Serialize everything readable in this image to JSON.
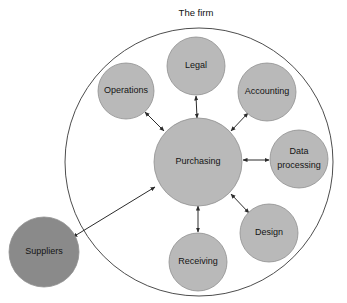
{
  "diagram": {
    "title": "The firm",
    "type": "hub-and-spoke network diagram",
    "canvas": {
      "width": 347,
      "height": 303,
      "background": "#ffffff"
    },
    "colors": {
      "node_fill_light": "#b9b9b9",
      "node_fill_dark": "#8a8a8a",
      "node_stroke": "#8f8f8f",
      "boundary_stroke": "#4d4d4d",
      "link_stroke": "#2b2b2b",
      "label_text": "#141414"
    },
    "boundary": {
      "label": "The firm",
      "label_x": 196,
      "label_y": 13,
      "cx": 199,
      "cy": 162,
      "r": 134
    },
    "nodes": [
      {
        "id": "legal",
        "label": "Legal",
        "label_line2": "",
        "cx": 196,
        "cy": 66,
        "r": 29,
        "fill": "#b9b9b9",
        "inside_firm": true
      },
      {
        "id": "operations",
        "label": "Operations",
        "label_line2": "",
        "cx": 126,
        "cy": 91,
        "r": 28,
        "fill": "#b9b9b9",
        "inside_firm": true
      },
      {
        "id": "accounting",
        "label": "Accounting",
        "label_line2": "",
        "cx": 267,
        "cy": 92,
        "r": 29,
        "fill": "#b9b9b9",
        "inside_firm": true
      },
      {
        "id": "purchasing",
        "label": "Purchasing",
        "label_line2": "",
        "cx": 198,
        "cy": 162,
        "r": 44,
        "fill": "#b9b9b9",
        "inside_firm": true
      },
      {
        "id": "data-processing",
        "label": "Data",
        "label_line2": "processing",
        "cx": 299,
        "cy": 159,
        "r": 29,
        "fill": "#b9b9b9",
        "inside_firm": true
      },
      {
        "id": "design",
        "label": "Design",
        "label_line2": "",
        "cx": 269,
        "cy": 233,
        "r": 29,
        "fill": "#b9b9b9",
        "inside_firm": true
      },
      {
        "id": "receiving",
        "label": "Receiving",
        "label_line2": "",
        "cx": 198,
        "cy": 262,
        "r": 29,
        "fill": "#b9b9b9",
        "inside_firm": true
      },
      {
        "id": "suppliers",
        "label": "Suppliers",
        "label_line2": "",
        "cx": 44,
        "cy": 252,
        "r": 35,
        "fill": "#8a8a8a",
        "inside_firm": false
      }
    ],
    "links": [
      {
        "from": "purchasing",
        "to": "legal",
        "arrows": "both",
        "x1": 197,
        "y1": 118,
        "x2": 196,
        "y2": 96
      },
      {
        "from": "purchasing",
        "to": "operations",
        "arrows": "both",
        "x1": 164,
        "y1": 131,
        "x2": 145,
        "y2": 112
      },
      {
        "from": "purchasing",
        "to": "accounting",
        "arrows": "both",
        "x1": 231,
        "y1": 131,
        "x2": 248,
        "y2": 113
      },
      {
        "from": "purchasing",
        "to": "data-processing",
        "arrows": "both",
        "x1": 243,
        "y1": 160,
        "x2": 269,
        "y2": 160
      },
      {
        "from": "purchasing",
        "to": "design",
        "arrows": "both",
        "x1": 231,
        "y1": 194,
        "x2": 249,
        "y2": 213
      },
      {
        "from": "purchasing",
        "to": "receiving",
        "arrows": "both",
        "x1": 198,
        "y1": 206,
        "x2": 198,
        "y2": 232
      },
      {
        "from": "purchasing",
        "to": "suppliers",
        "arrows": "both",
        "x1": 155,
        "y1": 187,
        "x2": 73,
        "y2": 237
      }
    ]
  }
}
